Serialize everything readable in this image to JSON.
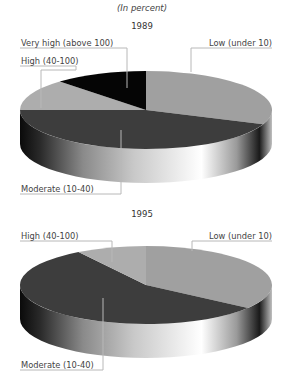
{
  "subtitle": "(In percent)",
  "colors": {
    "low": "#a0a0a0",
    "moderate": "#3d3d3d",
    "high": "#adadad",
    "very_high": "#050505",
    "leader": "#b8b8b8"
  },
  "pies": [
    {
      "year": "1989",
      "labels": {
        "very_high": "Very high (above 100)",
        "high": "High (40-100)",
        "low": "Low (under 10)",
        "moderate": "Moderate (10-40)"
      }
    },
    {
      "year": "1995",
      "labels": {
        "high": "High (40-100)",
        "low": "Low (under 10)",
        "moderate": "Moderate (10-40)"
      }
    }
  ],
  "chart_data": [
    {
      "type": "pie",
      "title": "1989",
      "subtitle": "(In percent)",
      "categories": [
        "Low (under 10)",
        "Moderate (10-40)",
        "High (40-100)",
        "Very high (above 100)"
      ],
      "values": [
        31,
        44,
        13,
        12
      ],
      "style": "3d"
    },
    {
      "type": "pie",
      "title": "1995",
      "subtitle": "(In percent)",
      "categories": [
        "Low (under 10)",
        "Moderate (10-40)",
        "High (40-100)"
      ],
      "values": [
        35,
        56,
        9
      ],
      "style": "3d"
    }
  ]
}
